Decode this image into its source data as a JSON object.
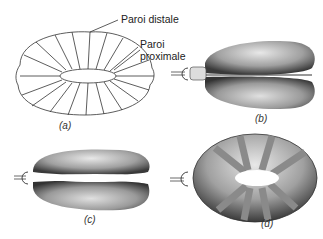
{
  "figure": {
    "labels": {
      "distal": "Paroi distale",
      "proximal_line1": "Paroi",
      "proximal_line2": "proximale"
    },
    "panels": [
      {
        "id": "a",
        "caption": "(a)",
        "description": "line drawing of toroidal balloon with radial ribs"
      },
      {
        "id": "b",
        "caption": "(b)",
        "description": "inflated shaded torus, front view"
      },
      {
        "id": "c",
        "caption": "(c)",
        "description": "inflated shaded torus, side view with central gap"
      },
      {
        "id": "d",
        "caption": "(d)",
        "description": "torus with gray radial bands"
      }
    ],
    "colors": {
      "line": "#333333",
      "shade_dark": "#555555",
      "shade_light": "#bbbbbb",
      "band": "#8a8a8a"
    }
  }
}
